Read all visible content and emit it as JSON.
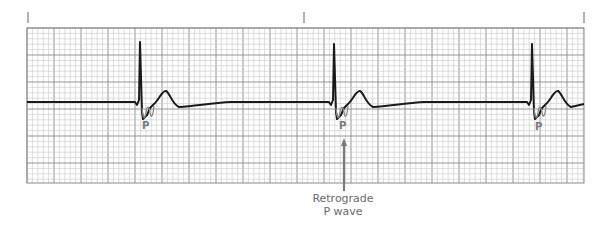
{
  "figure": {
    "type": "ECG rhythm strip",
    "timing_marks": [
      28,
      304,
      584
    ],
    "grid": {
      "left": 27,
      "top": 28,
      "right": 584,
      "bottom": 183,
      "minor_px": 5.4,
      "major_px": 27,
      "minor_color": "#c8c8c8",
      "major_color": "#8a8a8a"
    },
    "trace_color": "#1a1a1a",
    "p_wave_color": "#8a8a8a",
    "baseline_y": 102,
    "complexes": [
      {
        "r_x": 141,
        "r_top": 42,
        "p_label": "P",
        "p_label_x": 142,
        "p_label_y": 120
      },
      {
        "r_x": 335,
        "r_top": 44,
        "p_label": "P",
        "p_label_x": 339,
        "p_label_y": 120
      },
      {
        "r_x": 533,
        "r_top": 44,
        "p_label": "P",
        "p_label_x": 535,
        "p_label_y": 121
      }
    ],
    "annotation": {
      "line1": "Retrograde",
      "line2": "P wave",
      "arrow_x": 344,
      "arrow_tip_y": 138,
      "arrow_tail_y": 191
    }
  }
}
